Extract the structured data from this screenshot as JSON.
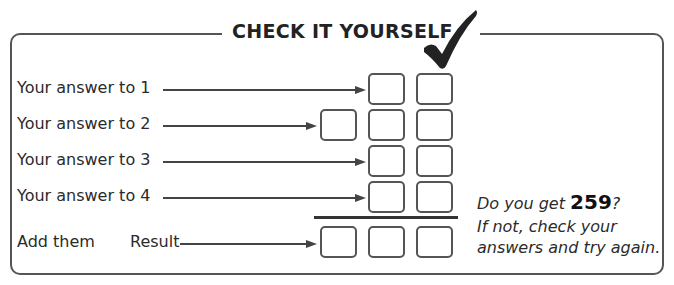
{
  "title": "CHECK IT YOURSELF",
  "rows": [
    {
      "label": "Your answer to 1"
    },
    {
      "label": "Your answer to 2"
    },
    {
      "label": "Your answer to 3"
    },
    {
      "label": "Your answer to 4"
    }
  ],
  "sum_row": {
    "label_add": "Add them",
    "label_result": "Result"
  },
  "note": {
    "line1_prefix": "Do you get ",
    "target_value": "259",
    "line1_suffix": "?",
    "line2": "If not, check your",
    "line3": "answers and try again."
  },
  "icons": {
    "title_mark": "checkmark-icon"
  },
  "colors": {
    "frame": "#555555",
    "text": "#2b2b2b",
    "divider": "#333333"
  }
}
